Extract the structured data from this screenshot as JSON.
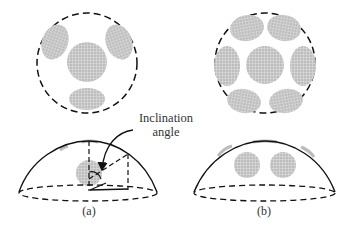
{
  "figure": {
    "annotation": {
      "line1": "Inclination",
      "line2": "angle"
    },
    "panels": [
      {
        "id": "a",
        "caption": "(a)",
        "top_view_patch_count": 4,
        "dome_visible_patches": 1
      },
      {
        "id": "b",
        "caption": "(b)",
        "top_view_patch_count": 7,
        "dome_visible_patches": 2
      }
    ],
    "colors": {
      "outline": "#111111",
      "patch_fill": "#b9b9b9",
      "patch_grid": "#d6d6d6",
      "background": "#ffffff"
    }
  }
}
